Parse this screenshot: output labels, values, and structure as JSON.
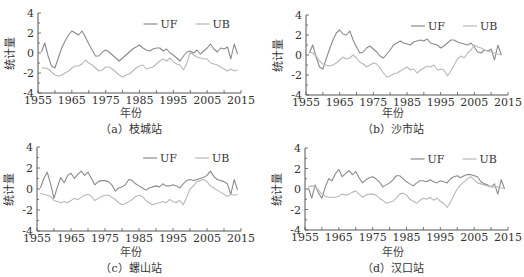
{
  "chart_data": [
    {
      "type": "line",
      "panel": "a",
      "caption": "（a）枝城站",
      "xlabel": "年份",
      "ylabel": "统计量",
      "xlim": [
        1955,
        2015
      ],
      "ylim": [
        -4,
        4
      ],
      "xticks": [
        1955,
        1965,
        1975,
        1985,
        1995,
        2005,
        2015
      ],
      "yticks": [
        4,
        2,
        0,
        -2,
        -4
      ],
      "grid": false,
      "legend": {
        "position": "top-right",
        "entries": [
          "UF",
          "UB"
        ]
      },
      "x": [
        1956,
        1957,
        1958,
        1959,
        1960,
        1961,
        1962,
        1963,
        1964,
        1965,
        1966,
        1967,
        1968,
        1969,
        1970,
        1971,
        1972,
        1973,
        1974,
        1975,
        1976,
        1977,
        1978,
        1979,
        1980,
        1981,
        1982,
        1983,
        1984,
        1985,
        1986,
        1987,
        1988,
        1989,
        1990,
        1991,
        1992,
        1993,
        1994,
        1995,
        1996,
        1997,
        1998,
        1999,
        2000,
        2001,
        2002,
        2003,
        2004,
        2005,
        2006,
        2007,
        2008,
        2009,
        2010,
        2011,
        2012,
        2013,
        2014
      ],
      "series": [
        {
          "name": "UF",
          "values": [
            0.1,
            1.0,
            -0.3,
            -1.3,
            -1.5,
            -0.5,
            0.5,
            1.2,
            1.8,
            2.2,
            2.0,
            1.8,
            2.2,
            1.6,
            0.9,
            0.3,
            -0.3,
            -0.3,
            0.1,
            0.3,
            0.1,
            -0.2,
            -0.5,
            -0.8,
            -0.5,
            -0.2,
            0.1,
            0.4,
            0.6,
            0.8,
            0.5,
            0.3,
            0.2,
            0.4,
            0.5,
            0.5,
            0.2,
            0.4,
            0.0,
            -0.2,
            -0.5,
            -0.8,
            -0.3,
            0.1,
            0.2,
            0.0,
            0.3,
            -0.1,
            0.2,
            0.5,
            0.9,
            0.4,
            0.1,
            0.5,
            0.4,
            0.6,
            -0.6,
            0.9,
            -0.1
          ]
        },
        {
          "name": "UB",
          "values": [
            -1.5,
            -1.5,
            -1.6,
            -1.9,
            -2.2,
            -2.3,
            -2.2,
            -2.0,
            -1.8,
            -1.5,
            -1.3,
            -1.3,
            -1.1,
            -0.7,
            -1.0,
            -1.2,
            -1.5,
            -1.8,
            -1.7,
            -1.4,
            -1.4,
            -1.6,
            -1.9,
            -2.2,
            -2.4,
            -2.2,
            -2.1,
            -1.8,
            -1.5,
            -1.3,
            -1.2,
            -1.6,
            -1.5,
            -1.4,
            -1.1,
            -0.8,
            -0.6,
            -0.8,
            -0.5,
            -0.9,
            -1.1,
            -1.2,
            -1.7,
            -1.0,
            0.1,
            -0.2,
            -0.4,
            -0.5,
            -0.6,
            -0.6,
            -1.0,
            -1.1,
            -1.2,
            -1.4,
            -1.6,
            -1.8,
            -1.6,
            -1.8,
            -1.7
          ]
        }
      ]
    },
    {
      "type": "line",
      "panel": "b",
      "caption": "（b）沙市站",
      "xlabel": "年份",
      "ylabel": "统计量",
      "xlim": [
        1955,
        2015
      ],
      "ylim": [
        -4,
        4
      ],
      "xticks": [
        1955,
        1965,
        1975,
        1985,
        1995,
        2005,
        2015
      ],
      "yticks": [
        4,
        2,
        0,
        -2,
        -4
      ],
      "grid": false,
      "legend": {
        "position": "top-right",
        "entries": [
          "UF",
          "UB"
        ]
      },
      "x": [
        1956,
        1957,
        1958,
        1959,
        1960,
        1961,
        1962,
        1963,
        1964,
        1965,
        1966,
        1967,
        1968,
        1969,
        1970,
        1971,
        1972,
        1973,
        1974,
        1975,
        1976,
        1977,
        1978,
        1979,
        1980,
        1981,
        1982,
        1983,
        1984,
        1985,
        1986,
        1987,
        1988,
        1989,
        1990,
        1991,
        1992,
        1993,
        1994,
        1995,
        1996,
        1997,
        1998,
        1999,
        2000,
        2001,
        2002,
        2003,
        2004,
        2005,
        2006,
        2007,
        2008,
        2009,
        2010,
        2011,
        2012,
        2013
      ],
      "series": [
        {
          "name": "UF",
          "values": [
            0.2,
            1.0,
            -0.2,
            -1.2,
            -1.4,
            -0.4,
            0.6,
            1.5,
            2.2,
            2.5,
            2.1,
            2.0,
            2.4,
            1.5,
            0.8,
            0.2,
            0.3,
            0.7,
            0.9,
            0.6,
            0.3,
            -0.1,
            -0.3,
            0.1,
            0.5,
            1.0,
            1.2,
            1.4,
            1.2,
            1.1,
            1.0,
            1.3,
            1.4,
            1.5,
            1.4,
            1.6,
            1.2,
            1.1,
            1.0,
            0.7,
            0.9,
            1.2,
            1.5,
            1.5,
            1.3,
            1.2,
            1.1,
            1.0,
            1.2,
            0.8,
            0.3,
            0.2,
            0.5,
            0.4,
            0.6,
            -0.5,
            1.0,
            0.0
          ]
        },
        {
          "name": "UB",
          "values": [
            0.3,
            0.2,
            -0.1,
            -0.6,
            -0.9,
            -1.0,
            -1.1,
            -1.0,
            -0.8,
            -0.5,
            -0.2,
            -0.4,
            -0.3,
            0.0,
            -0.3,
            -0.7,
            -0.9,
            -1.2,
            -1.0,
            -0.8,
            -0.9,
            -1.3,
            -1.8,
            -2.2,
            -2.1,
            -1.9,
            -1.8,
            -1.6,
            -1.4,
            -1.2,
            -1.5,
            -1.4,
            -1.8,
            -1.5,
            -1.3,
            -1.1,
            -1.2,
            -1.0,
            -1.5,
            -1.4,
            -1.5,
            -2.1,
            -1.6,
            -1.0,
            -0.4,
            -0.1,
            -0.3,
            0.2,
            0.5,
            1.0,
            0.8,
            0.7,
            0.5,
            0.4,
            0.3,
            0.2,
            0.1,
            0.0
          ]
        }
      ]
    },
    {
      "type": "line",
      "panel": "c",
      "caption": "（c）螺山站",
      "xlabel": "年份",
      "ylabel": "统计量",
      "xlim": [
        1955,
        2015
      ],
      "ylim": [
        -4,
        4
      ],
      "xticks": [
        1955,
        1965,
        1975,
        1985,
        1995,
        2005,
        2015
      ],
      "yticks": [
        4,
        2,
        0,
        -2,
        -4
      ],
      "grid": false,
      "legend": {
        "position": "top-right",
        "entries": [
          "UF",
          "UB"
        ]
      },
      "x": [
        1956,
        1957,
        1958,
        1959,
        1960,
        1961,
        1962,
        1963,
        1964,
        1965,
        1966,
        1967,
        1968,
        1969,
        1970,
        1971,
        1972,
        1973,
        1974,
        1975,
        1976,
        1977,
        1978,
        1979,
        1980,
        1981,
        1982,
        1983,
        1984,
        1985,
        1986,
        1987,
        1988,
        1989,
        1990,
        1991,
        1992,
        1993,
        1994,
        1995,
        1996,
        1997,
        1998,
        1999,
        2000,
        2001,
        2002,
        2003,
        2004,
        2005,
        2006,
        2007,
        2008,
        2009,
        2010,
        2011,
        2012,
        2013,
        2014
      ],
      "series": [
        {
          "name": "UF",
          "values": [
            0.1,
            1.0,
            1.6,
            0.5,
            -0.9,
            0.2,
            1.1,
            0.6,
            1.3,
            1.5,
            1.0,
            1.4,
            1.7,
            1.3,
            1.6,
            1.0,
            0.4,
            0.7,
            0.8,
            0.8,
            0.7,
            0.4,
            -0.2,
            0.1,
            0.2,
            0.4,
            0.9,
            0.8,
            0.5,
            0.3,
            0.1,
            -0.1,
            0.1,
            0.2,
            0.3,
            0.2,
            0.5,
            0.3,
            0.3,
            0.4,
            0.3,
            0.1,
            0.5,
            0.8,
            0.9,
            0.8,
            0.9,
            1.0,
            1.1,
            1.3,
            1.7,
            1.2,
            0.9,
            0.8,
            0.7,
            0.5,
            -0.5,
            0.9,
            -0.1
          ]
        },
        {
          "name": "UB",
          "values": [
            -0.4,
            -0.5,
            -0.6,
            -0.7,
            -1.1,
            -1.2,
            -1.3,
            -1.2,
            -1.3,
            -1.1,
            -0.9,
            -1.0,
            -0.8,
            -0.6,
            -0.5,
            -0.7,
            -1.1,
            -0.9,
            -0.7,
            -0.6,
            -0.6,
            -0.8,
            -1.0,
            -1.3,
            -1.5,
            -1.4,
            -1.2,
            -1.0,
            -0.7,
            -0.6,
            -0.7,
            -1.1,
            -1.3,
            -1.5,
            -1.4,
            -1.3,
            -1.2,
            -1.3,
            -1.0,
            -1.2,
            -1.3,
            -1.1,
            -1.5,
            -0.8,
            0.0,
            0.3,
            0.7,
            0.8,
            0.9,
            0.7,
            0.3,
            0.1,
            -0.1,
            -0.3,
            -0.5,
            -0.7,
            -0.5,
            -0.6,
            -0.5
          ]
        }
      ]
    },
    {
      "type": "line",
      "panel": "d",
      "caption": "（d）汉口站",
      "xlabel": "年份",
      "ylabel": "统计量",
      "xlim": [
        1955,
        2015
      ],
      "ylim": [
        -4,
        4
      ],
      "xticks": [
        1955,
        1965,
        1975,
        1985,
        1995,
        2005,
        2015
      ],
      "yticks": [
        4,
        2,
        0,
        -2,
        -4
      ],
      "grid": false,
      "legend": {
        "position": "top-right",
        "entries": [
          "UF",
          "UB"
        ]
      },
      "x": [
        1956,
        1957,
        1958,
        1959,
        1960,
        1961,
        1962,
        1963,
        1964,
        1965,
        1966,
        1967,
        1968,
        1969,
        1970,
        1971,
        1972,
        1973,
        1974,
        1975,
        1976,
        1977,
        1978,
        1979,
        1980,
        1981,
        1982,
        1983,
        1984,
        1985,
        1986,
        1987,
        1988,
        1989,
        1990,
        1991,
        1992,
        1993,
        1994,
        1995,
        1996,
        1997,
        1998,
        1999,
        2000,
        2001,
        2002,
        2003,
        2004,
        2005,
        2006,
        2007,
        2008,
        2009,
        2010,
        2011,
        2012,
        2013,
        2014
      ],
      "series": [
        {
          "name": "UF",
          "values": [
            0.1,
            -0.9,
            0.4,
            -0.4,
            -0.9,
            0.2,
            1.0,
            0.8,
            1.5,
            1.9,
            1.2,
            1.5,
            1.8,
            1.4,
            1.7,
            1.1,
            0.6,
            0.9,
            1.1,
            1.2,
            1.0,
            0.7,
            0.2,
            0.4,
            0.6,
            0.9,
            1.3,
            1.3,
            1.0,
            0.7,
            0.5,
            0.3,
            0.6,
            0.8,
            0.8,
            0.7,
            0.9,
            0.7,
            0.6,
            0.8,
            0.7,
            0.6,
            1.0,
            1.2,
            1.3,
            1.1,
            1.3,
            1.4,
            1.4,
            1.3,
            1.2,
            0.7,
            0.5,
            0.4,
            0.2,
            0.5,
            -0.5,
            0.9,
            0.0
          ]
        },
        {
          "name": "UB",
          "values": [
            0.2,
            0.3,
            0.2,
            -0.1,
            -0.5,
            -0.7,
            -0.8,
            -0.8,
            -0.8,
            -0.7,
            -0.5,
            -0.6,
            -0.5,
            -0.3,
            -0.2,
            -0.5,
            -0.8,
            -0.6,
            -0.5,
            -0.5,
            -0.6,
            -0.9,
            -1.1,
            -1.4,
            -1.3,
            -1.2,
            -0.9,
            -0.5,
            -0.4,
            -0.6,
            -1.0,
            -1.2,
            -1.4,
            -1.1,
            -0.9,
            -1.0,
            -0.8,
            -1.1,
            -0.9,
            -1.2,
            -1.4,
            -1.8,
            -1.3,
            -0.6,
            0.0,
            0.4,
            0.7,
            1.0,
            1.2,
            0.9,
            0.6,
            0.5,
            0.4,
            0.3,
            0.2,
            0.2,
            0.2,
            0.1,
            0.1
          ]
        }
      ]
    }
  ],
  "colors": {
    "UF": "#8a8a8a",
    "UB": "#b8b8b8",
    "axis": "#555555",
    "text": "#333333"
  }
}
